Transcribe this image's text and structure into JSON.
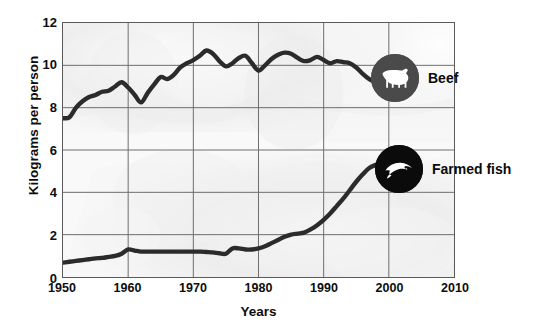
{
  "chart_data": {
    "type": "line",
    "title": "",
    "xlabel": "Years",
    "ylabel": "Kilograms per person",
    "xlim": [
      1950,
      2010
    ],
    "ylim": [
      0,
      12
    ],
    "xticks": [
      1950,
      1960,
      1970,
      1980,
      1990,
      2000,
      2010
    ],
    "yticks": [
      0,
      2,
      4,
      6,
      8,
      10,
      12
    ],
    "grid": true,
    "legend_position": "inside-right",
    "series": [
      {
        "name": "Beef",
        "icon": "cow-icon",
        "color": "#2b2b2b",
        "x": [
          1950,
          1951,
          1952,
          1953,
          1954,
          1955,
          1956,
          1957,
          1958,
          1959,
          1960,
          1961,
          1962,
          1963,
          1964,
          1965,
          1966,
          1967,
          1968,
          1969,
          1970,
          1971,
          1972,
          1973,
          1974,
          1975,
          1976,
          1977,
          1978,
          1979,
          1980,
          1981,
          1982,
          1983,
          1984,
          1985,
          1986,
          1987,
          1988,
          1989,
          1990,
          1991,
          1992,
          1993,
          1994,
          1995,
          1996,
          1997,
          1998
        ],
        "values": [
          7.5,
          7.55,
          8.0,
          8.3,
          8.5,
          8.6,
          8.75,
          8.8,
          9.0,
          9.2,
          8.95,
          8.6,
          8.25,
          8.7,
          9.1,
          9.45,
          9.35,
          9.55,
          9.9,
          10.1,
          10.25,
          10.45,
          10.7,
          10.55,
          10.2,
          9.95,
          10.1,
          10.35,
          10.45,
          10.1,
          9.75,
          10.0,
          10.3,
          10.5,
          10.6,
          10.55,
          10.35,
          10.2,
          10.25,
          10.4,
          10.25,
          10.1,
          10.2,
          10.15,
          10.1,
          9.9,
          9.6,
          9.35,
          9.2
        ]
      },
      {
        "name": "Farmed fish",
        "icon": "fish-icon",
        "color": "#2b2b2b",
        "x": [
          1950,
          1951,
          1952,
          1953,
          1954,
          1955,
          1956,
          1957,
          1958,
          1959,
          1960,
          1961,
          1962,
          1963,
          1964,
          1965,
          1966,
          1967,
          1968,
          1969,
          1970,
          1971,
          1972,
          1973,
          1974,
          1975,
          1976,
          1977,
          1978,
          1979,
          1980,
          1981,
          1982,
          1983,
          1984,
          1985,
          1986,
          1987,
          1988,
          1989,
          1990,
          1991,
          1992,
          1993,
          1994,
          1995,
          1996,
          1997,
          1998
        ],
        "values": [
          0.68,
          0.72,
          0.76,
          0.8,
          0.84,
          0.88,
          0.9,
          0.95,
          1.0,
          1.1,
          1.3,
          1.25,
          1.2,
          1.2,
          1.2,
          1.2,
          1.2,
          1.2,
          1.2,
          1.2,
          1.2,
          1.2,
          1.18,
          1.16,
          1.12,
          1.1,
          1.35,
          1.35,
          1.3,
          1.3,
          1.35,
          1.45,
          1.6,
          1.75,
          1.9,
          2.0,
          2.05,
          2.1,
          2.25,
          2.45,
          2.7,
          3.0,
          3.35,
          3.7,
          4.1,
          4.5,
          4.85,
          5.15,
          5.3
        ]
      }
    ]
  },
  "legend": {
    "items": [
      {
        "label": "Beef",
        "icon": "cow-icon"
      },
      {
        "label": "Farmed fish",
        "icon": "fish-icon"
      }
    ]
  }
}
